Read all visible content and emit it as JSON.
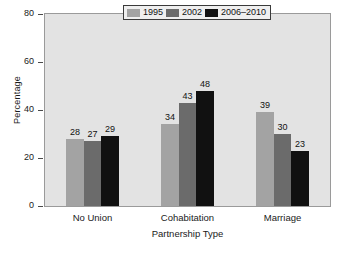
{
  "chart_data": {
    "type": "bar",
    "title": "",
    "xlabel": "Partnership Type",
    "ylabel": "Percentage",
    "categories": [
      "No Union",
      "Cohabitation",
      "Marriage"
    ],
    "series": [
      {
        "name": "1995",
        "color": "#a3a3a3",
        "values": [
          28,
          34,
          39
        ]
      },
      {
        "name": "2002",
        "color": "#6b6b6b",
        "values": [
          27,
          43,
          30
        ]
      },
      {
        "name": "2006–2010",
        "color": "#111111",
        "values": [
          29,
          48,
          23
        ]
      }
    ],
    "ylim": [
      0,
      80
    ],
    "yticks": [
      0,
      20,
      40,
      60,
      80
    ],
    "ytick_labels": [
      "0",
      "20",
      "40",
      "60",
      "80"
    ],
    "grid": false,
    "legend_position": "top-right",
    "value_labels": true,
    "plot_background": "#e3e3e3"
  }
}
